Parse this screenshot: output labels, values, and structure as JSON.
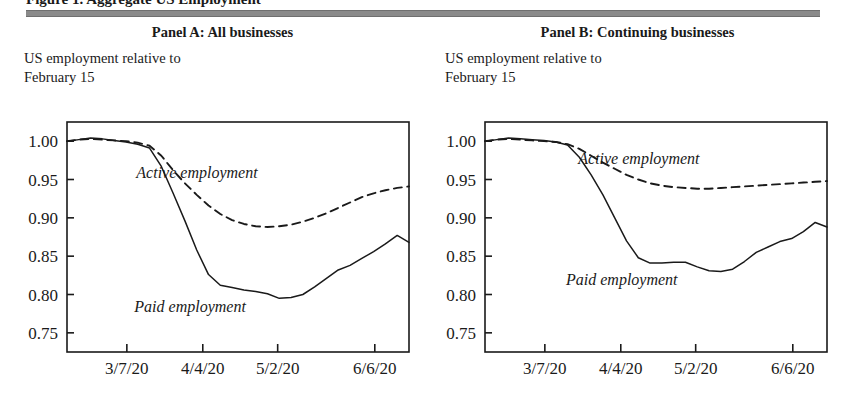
{
  "figure": {
    "title_clipped": "Figure 1. Aggregate US Employment",
    "rule_color": "#8a8a8a"
  },
  "panels": [
    {
      "id": "panel-a",
      "header": "Panel A: All businesses",
      "subtitle": "US employment relative to\nFebruary 15"
    },
    {
      "id": "panel-b",
      "header": "Panel B: Continuing businesses",
      "subtitle": "US employment relative to\nFebruary 15"
    }
  ],
  "chart_data": [
    {
      "type": "line",
      "title": "Panel A: All businesses",
      "subtitle": "US employment relative to February 15",
      "xlabel": "",
      "ylabel": "",
      "ylim": [
        0.725,
        1.025
      ],
      "yticks": [
        "1.00",
        "0.95",
        "0.90",
        "0.85",
        "0.80",
        "0.75"
      ],
      "ytick_values": [
        1.0,
        0.95,
        0.9,
        0.85,
        0.8,
        0.75
      ],
      "xticks": [
        "3/7/20",
        "4/4/20",
        "5/2/20",
        "6/6/20"
      ],
      "xtick_positions": [
        0.175,
        0.397,
        0.616,
        0.9
      ],
      "grid": false,
      "legend": "inline-annotation",
      "series": [
        {
          "name": "Active employment",
          "style": "dashed",
          "label_x": 0.38,
          "label_y": 0.952,
          "values": [
            1.0,
            1.002,
            1.003,
            1.002,
            1.001,
            1.0,
            0.998,
            0.994,
            0.981,
            0.962,
            0.945,
            0.93,
            0.916,
            0.905,
            0.897,
            0.892,
            0.889,
            0.888,
            0.889,
            0.891,
            0.895,
            0.9,
            0.906,
            0.913,
            0.92,
            0.927,
            0.932,
            0.936,
            0.939,
            0.941
          ]
        },
        {
          "name": "Paid employment",
          "style": "solid",
          "label_x": 0.36,
          "label_y": 0.777,
          "values": [
            1.0,
            1.002,
            1.004,
            1.003,
            1.001,
            0.999,
            0.996,
            0.991,
            0.967,
            0.932,
            0.896,
            0.858,
            0.826,
            0.812,
            0.809,
            0.806,
            0.804,
            0.801,
            0.795,
            0.796,
            0.8,
            0.81,
            0.821,
            0.832,
            0.838,
            0.847,
            0.856,
            0.866,
            0.877,
            0.868
          ]
        }
      ]
    },
    {
      "type": "line",
      "title": "Panel B: Continuing businesses",
      "subtitle": "US employment relative to February 15",
      "xlabel": "",
      "ylabel": "",
      "ylim": [
        0.725,
        1.025
      ],
      "yticks": [
        "1.00",
        "0.95",
        "0.90",
        "0.85",
        "0.80",
        "0.75"
      ],
      "ytick_values": [
        1.0,
        0.95,
        0.9,
        0.85,
        0.8,
        0.75
      ],
      "xticks": [
        "3/7/20",
        "4/4/20",
        "5/2/20",
        "6/6/20"
      ],
      "xtick_positions": [
        0.175,
        0.397,
        0.616,
        0.9
      ],
      "grid": false,
      "legend": "inline-annotation",
      "series": [
        {
          "name": "Active employment",
          "style": "dashed",
          "label_x": 0.45,
          "label_y": 0.97,
          "values": [
            1.0,
            1.002,
            1.003,
            1.002,
            1.001,
            1.0,
            0.999,
            0.996,
            0.99,
            0.981,
            0.972,
            0.964,
            0.956,
            0.95,
            0.945,
            0.942,
            0.94,
            0.939,
            0.938,
            0.938,
            0.939,
            0.94,
            0.941,
            0.942,
            0.943,
            0.944,
            0.945,
            0.946,
            0.947,
            0.948
          ]
        },
        {
          "name": "Paid employment",
          "style": "solid",
          "label_x": 0.4,
          "label_y": 0.812,
          "values": [
            1.0,
            1.002,
            1.004,
            1.003,
            1.002,
            1.001,
            0.999,
            0.995,
            0.979,
            0.956,
            0.93,
            0.9,
            0.87,
            0.848,
            0.841,
            0.841,
            0.842,
            0.842,
            0.836,
            0.831,
            0.83,
            0.833,
            0.843,
            0.855,
            0.862,
            0.869,
            0.873,
            0.882,
            0.894,
            0.888
          ]
        }
      ]
    }
  ]
}
